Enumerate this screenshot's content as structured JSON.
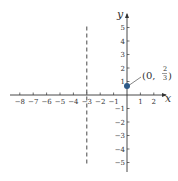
{
  "chart_data": {
    "type": "line",
    "title": "",
    "xlabel": "x",
    "ylabel": "y",
    "xlim": [
      -8.5,
      3
    ],
    "ylim": [
      -6,
      6
    ],
    "grid": false,
    "x_ticks": [
      -8,
      -7,
      -6,
      -5,
      -4,
      -3,
      -2,
      -1,
      1,
      2
    ],
    "y_ticks": [
      -5,
      -4,
      -3,
      -2,
      -1,
      1,
      2,
      3,
      4,
      5
    ],
    "x_tick_labels": [
      "−8",
      "−7",
      "−6",
      "−5",
      "−4",
      "−3",
      "−2",
      "−1",
      "1",
      "2"
    ],
    "y_tick_labels": [
      "−5",
      "−4",
      "−3",
      "−2",
      "−1",
      "1",
      "2",
      "3",
      "4",
      "5"
    ],
    "series": [
      {
        "name": "vertical asymptote",
        "style": "dashed",
        "equation": "x = -3",
        "x": [
          -3,
          -3
        ],
        "y": [
          -5,
          5
        ]
      },
      {
        "name": "y-intercept",
        "style": "point",
        "x": [
          0
        ],
        "y": [
          0.6667
        ],
        "label": "(0, 2/3)"
      }
    ],
    "annotations": [
      {
        "text": "(0, 2/3)",
        "x": 0,
        "y": 0.6667
      }
    ],
    "colors": {
      "axis": "#333333",
      "point": "#2e5a87",
      "dashed": "#333333"
    }
  },
  "labels": {
    "x_axis": "x",
    "y_axis": "y",
    "point_prefix": "(0, ",
    "point_num": "2",
    "point_den": "3",
    "point_suffix": ")"
  }
}
